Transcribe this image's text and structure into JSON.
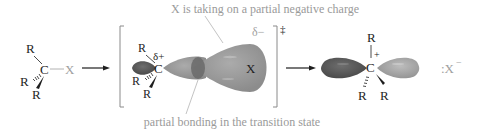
{
  "annotations": {
    "top": "X is taking on a partial negative charge",
    "bottom": "partial bonding in the transition state"
  },
  "reactant": {
    "substituent_top": "R",
    "substituent_left": "R",
    "substituent_bottom": "R",
    "center": "C",
    "leaving_group": "X"
  },
  "transition_state": {
    "substituent_top": "R",
    "substituent_left": "R",
    "substituent_bottom": "R",
    "center": "C",
    "partial_positive": "δ+",
    "partial_negative": "δ−",
    "leaving_group": "X",
    "double_dagger": "‡"
  },
  "product": {
    "substituent_top": "R",
    "substituent_left": "R",
    "substituent_right": "R",
    "center": "C",
    "charge": "+",
    "leaving_ion": ":X",
    "leaving_ion_charge": "−"
  },
  "colors": {
    "annotation_text": "#9a9a9a",
    "annotation_line": "#b4b4b4",
    "dark_lobe": "#5a5a5a",
    "light_lobe": "#a8a8a8",
    "ts_lobe": "#9c9c9c",
    "ink": "#1e1e1e",
    "grey_ink": "#a0a0a0"
  }
}
